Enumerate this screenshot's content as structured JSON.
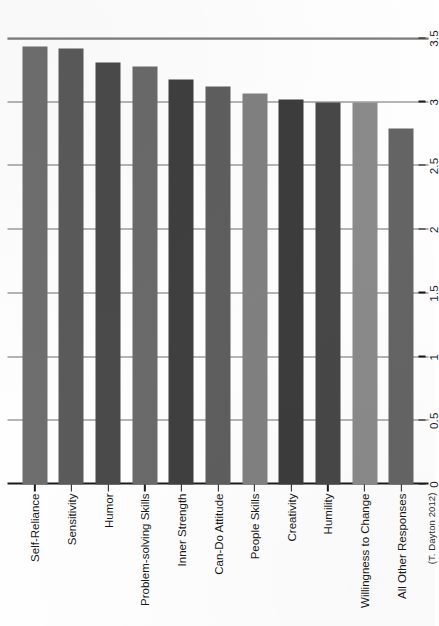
{
  "credit": "(T. Dayton 2012)",
  "chart_data": {
    "type": "bar",
    "orientation": "vertical-rotated",
    "title": "",
    "subtitle": "",
    "xlabel": "",
    "ylabel": "",
    "ylim": [
      0,
      3.5
    ],
    "grid": true,
    "legend": false,
    "legend_position": "none",
    "tick_labels": [
      "0",
      "0.5",
      "1",
      "1.5",
      "2",
      "2.5",
      "3",
      "3.5"
    ],
    "ticks": [
      0,
      0.5,
      1,
      1.5,
      2,
      2.5,
      3,
      3.5
    ],
    "categories": [
      "Self-Reliance",
      "Sensitivity",
      "Humor",
      "Problem-solving Skills",
      "Inner Strength",
      "Can-Do Attitude",
      "People Skills",
      "Creativity",
      "Humility",
      "Willingness to Change",
      "All Other Responses"
    ],
    "values": [
      3.44,
      3.42,
      3.31,
      3.28,
      3.18,
      3.12,
      3.07,
      3.02,
      3.0,
      3.0,
      2.79
    ],
    "bar_colors": [
      "#6e6e6e",
      "#5a5a5a",
      "#4a4a4a",
      "#6a6a6a",
      "#3f3f3f",
      "#5e5e5e",
      "#808080",
      "#3c3c3c",
      "#474747",
      "#8a8a8a",
      "#646464"
    ]
  }
}
